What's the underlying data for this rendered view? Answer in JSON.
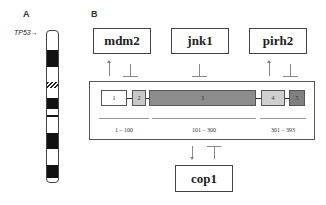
{
  "panel_a": {
    "label": "A",
    "gene_label": "TP53",
    "gene_arrow": "→",
    "chromosome_bands": [
      {
        "type": "solid",
        "top": 19,
        "height": 17
      },
      {
        "type": "hatched",
        "top": 51,
        "height": 6
      },
      {
        "type": "solid",
        "top": 67,
        "height": 11
      },
      {
        "type": "solid",
        "top": 84,
        "height": 2
      },
      {
        "type": "solid",
        "top": 102,
        "height": 16
      },
      {
        "type": "solid",
        "top": 134,
        "height": 13
      }
    ]
  },
  "panel_b": {
    "label": "B",
    "interactors_top": [
      {
        "name": "mdm2",
        "activation": true,
        "inhibition": true
      },
      {
        "name": "jnk1",
        "activation": false,
        "inhibition": true
      },
      {
        "name": "pirh2",
        "activation": true,
        "inhibition": true
      }
    ],
    "interactor_bottom": {
      "name": "cop1",
      "activation": true,
      "inhibition": true
    },
    "domains": [
      {
        "label": "1",
        "color": "#ffffff"
      },
      {
        "label": "2",
        "color": "#c8c8c8"
      },
      {
        "label": "3",
        "color": "#8c8c8c"
      },
      {
        "label": "4",
        "color": "#cfcfcf"
      },
      {
        "label": "5",
        "color": "#808080"
      }
    ],
    "ranges": [
      {
        "label": "1 – 100"
      },
      {
        "label": "101 – 300"
      },
      {
        "label": "301 – 393"
      }
    ]
  }
}
